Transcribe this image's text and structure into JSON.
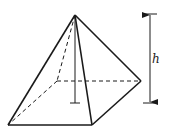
{
  "diagram": {
    "shape": "square-pyramid",
    "labels": {
      "height": "h"
    },
    "colors": {
      "stroke": "#1a1a1a",
      "background": "#ffffff"
    },
    "points": {
      "apex": [
        75,
        15
      ],
      "front_left": [
        8,
        125
      ],
      "front_right": [
        92,
        125
      ],
      "right": [
        141,
        81
      ],
      "back_left_hidden": [
        57,
        81
      ],
      "height_foot": [
        75,
        103
      ]
    },
    "dimension_arrow": {
      "x": 150,
      "top": 14,
      "bottom": 103,
      "label": "h"
    }
  }
}
